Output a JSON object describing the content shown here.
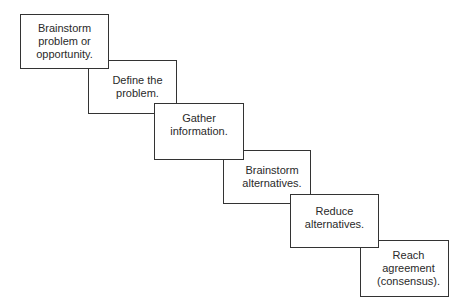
{
  "diagram": {
    "type": "staircase-process",
    "steps": [
      {
        "label": "Brainstorm\nproblem or\nopportunity."
      },
      {
        "label": "Define the\nproblem."
      },
      {
        "label": "Gather\ninformation."
      },
      {
        "label": "Brainstorm\nalternatives."
      },
      {
        "label": "Reduce\nalternatives."
      },
      {
        "label": "Reach\nagreement\n(consensus)."
      }
    ]
  }
}
